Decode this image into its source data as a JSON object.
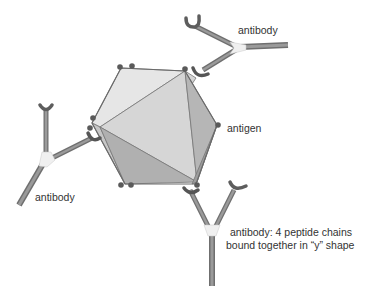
{
  "diagram": {
    "type": "labeled-illustration",
    "labels": {
      "antibody_top": "antibody",
      "antigen": "antigen",
      "antibody_left": "antibody",
      "antibody_bottom_line1": "antibody: 4 peptide chains",
      "antibody_bottom_line2": "bound together in “y” shape"
    },
    "colors": {
      "face_light": "#e4e4e4",
      "face_mid": "#cfcfcf",
      "face_dark": "#b4b4b4",
      "face_darker": "#a2a2a2",
      "edge": "#707070",
      "binding_site": "#5a5a5a",
      "antibody_chain": "#8a8a8a",
      "antibody_junction": "#f2f2f2",
      "text": "#333333"
    }
  }
}
